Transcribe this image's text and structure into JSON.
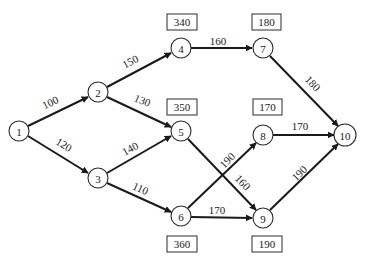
{
  "diagram": {
    "type": "network-graph",
    "nodes": [
      {
        "id": "1",
        "label": "1"
      },
      {
        "id": "2",
        "label": "2"
      },
      {
        "id": "3",
        "label": "3"
      },
      {
        "id": "4",
        "label": "4"
      },
      {
        "id": "5",
        "label": "5"
      },
      {
        "id": "6",
        "label": "6"
      },
      {
        "id": "7",
        "label": "7"
      },
      {
        "id": "8",
        "label": "8"
      },
      {
        "id": "9",
        "label": "9"
      },
      {
        "id": "10",
        "label": "10"
      }
    ],
    "edges": [
      {
        "from": "1",
        "to": "2",
        "weight": "100"
      },
      {
        "from": "1",
        "to": "3",
        "weight": "120"
      },
      {
        "from": "2",
        "to": "4",
        "weight": "150"
      },
      {
        "from": "2",
        "to": "5",
        "weight": "130"
      },
      {
        "from": "3",
        "to": "5",
        "weight": "140"
      },
      {
        "from": "3",
        "to": "6",
        "weight": "110"
      },
      {
        "from": "4",
        "to": "7",
        "weight": "160"
      },
      {
        "from": "5",
        "to": "9",
        "weight": "160"
      },
      {
        "from": "6",
        "to": "8",
        "weight": "190"
      },
      {
        "from": "6",
        "to": "9",
        "weight": "170"
      },
      {
        "from": "7",
        "to": "10",
        "weight": "180"
      },
      {
        "from": "8",
        "to": "10",
        "weight": "170"
      },
      {
        "from": "9",
        "to": "10",
        "weight": "190"
      }
    ],
    "node_boxes": [
      {
        "node": "4",
        "value": "340"
      },
      {
        "node": "7",
        "value": "180"
      },
      {
        "node": "5",
        "value": "350"
      },
      {
        "node": "8",
        "value": "170"
      },
      {
        "node": "6",
        "value": "360"
      },
      {
        "node": "9",
        "value": "190"
      }
    ]
  }
}
